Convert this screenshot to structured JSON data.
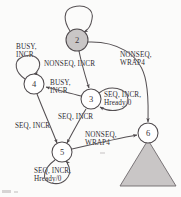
{
  "diagram": {
    "type": "state-transition-diagram",
    "colors": {
      "stroke": "#4f4a4d",
      "fill_active": "#c9c6c6",
      "fill_idle": "#ffffff",
      "text": "#2f2b30",
      "background": "#fbfbfa"
    },
    "nodes": [
      {
        "id": "node-2",
        "label": "2",
        "x": 77,
        "y": 40,
        "r": 11,
        "filled": true
      },
      {
        "id": "node-4",
        "label": "4",
        "x": 34,
        "y": 84,
        "r": 10,
        "filled": false
      },
      {
        "id": "node-3",
        "label": "3",
        "x": 91,
        "y": 99,
        "r": 10,
        "filled": false
      },
      {
        "id": "node-5",
        "label": "5",
        "x": 62,
        "y": 152,
        "r": 10,
        "filled": false
      },
      {
        "id": "node-6",
        "label": "6",
        "x": 148,
        "y": 133,
        "r": 10,
        "filled": false
      }
    ],
    "terminal": {
      "id": "terminal-triangle",
      "x": 148,
      "y": 143,
      "width": 56,
      "height": 43
    },
    "edge_labels": [
      {
        "id": "label-2-self",
        "text": "",
        "line1": "",
        "line2": "",
        "x": 72,
        "y": 14
      },
      {
        "id": "label-4-self",
        "text": "BUSY, INCR",
        "line1": "BUSY,",
        "line2": "INCR",
        "x": 16,
        "y": 48
      },
      {
        "id": "label-2-to-3",
        "text": "NONSEQ, INCR",
        "line1": "NONSEQ, INCR",
        "line2": "",
        "x": 44,
        "y": 63
      },
      {
        "id": "label-2-to-6",
        "text": "NONSEQ, WRAP4",
        "line1": "NONSEQ,",
        "line2": "WRAP4",
        "x": 122,
        "y": 57
      },
      {
        "id": "label-3-to-4",
        "text": "BUSY, INCR",
        "line1": "BUSY,",
        "line2": "INCR",
        "x": 51,
        "y": 84
      },
      {
        "id": "label-3-self",
        "text": "SEQ, INCR, Hready/0",
        "line1": "SEQ, INCR,",
        "line2": "Hready/0",
        "x": 106,
        "y": 91
      },
      {
        "id": "label-3-to-5",
        "text": "SEQ, INCR",
        "line1": "SEQ, INCR",
        "line2": "",
        "x": 60,
        "y": 117
      },
      {
        "id": "label-4-to-5",
        "text": "SEQ, INCR",
        "line1": "SEQ, INCR",
        "line2": "",
        "x": 17,
        "y": 125
      },
      {
        "id": "label-5-to-6",
        "text": "NONSEQ, WRAP4",
        "line1": "NONSEQ,",
        "line2": "WRAP4",
        "x": 84,
        "y": 133
      },
      {
        "id": "label-5-self",
        "text": "SEQ, INCR, Hready/0",
        "line1": "SEQ, INCR,",
        "line2": "Hready/0",
        "x": 36,
        "y": 170
      }
    ],
    "transitions": [
      {
        "id": "edge-2-self",
        "from": "2",
        "to": "2",
        "label": ""
      },
      {
        "id": "edge-4-self",
        "from": "4",
        "to": "4",
        "label": "BUSY, INCR"
      },
      {
        "id": "edge-2-to-3",
        "from": "2",
        "to": "3",
        "label": "NONSEQ, INCR"
      },
      {
        "id": "edge-2-to-6",
        "from": "2",
        "to": "6",
        "label": "NONSEQ, WRAP4"
      },
      {
        "id": "edge-3-to-4",
        "from": "3",
        "to": "4",
        "label": "BUSY, INCR"
      },
      {
        "id": "edge-3-self",
        "from": "3",
        "to": "3",
        "label": "SEQ, INCR, Hready/0"
      },
      {
        "id": "edge-3-to-5",
        "from": "3",
        "to": "5",
        "label": "SEQ, INCR"
      },
      {
        "id": "edge-4-to-5",
        "from": "4",
        "to": "5",
        "label": "SEQ, INCR"
      },
      {
        "id": "edge-5-to-6",
        "from": "5",
        "to": "6",
        "label": "NONSEQ, WRAP4"
      },
      {
        "id": "edge-5-self",
        "from": "5",
        "to": "5",
        "label": "SEQ, INCR, Hready/0"
      }
    ]
  }
}
